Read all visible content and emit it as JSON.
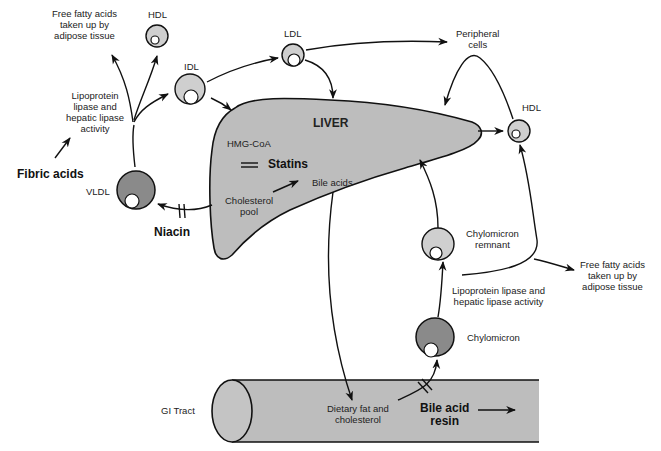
{
  "diagram": {
    "colors": {
      "background": "#ffffff",
      "organ_fill": "#bdbdbd",
      "light_particle_fill": "#cfcfcf",
      "dark_particle_fill": "#8a8a8a",
      "line": "#111111"
    },
    "organs": {
      "liver": "LIVER",
      "gi_tract": "GI Tract"
    },
    "liver_contents": {
      "hmg_coa": "HMG-CoA",
      "statins": "Statins",
      "bile_acids": "Bile acids",
      "cholesterol_pool_1": "Cholesterol",
      "cholesterol_pool_2": "pool"
    },
    "lipoproteins": {
      "hdl_top": "HDL",
      "idl": "IDL",
      "ldl": "LDL",
      "vldl": "VLDL",
      "hdl_right": "HDL",
      "chylomicron_remnant_1": "Chylomicron",
      "chylomicron_remnant_2": "remnant",
      "chylomicron": "Chylomicron"
    },
    "drugs": {
      "fibric_acids": "Fibric acids",
      "niacin": "Niacin",
      "bile_acid_resin_1": "Bile acid",
      "bile_acid_resin_2": "resin"
    },
    "processes": {
      "ffa_left_1": "Free fatty acids",
      "ffa_left_2": "taken up by",
      "ffa_left_3": "adipose tissue",
      "lpl_left_1": "Lipoprotein",
      "lpl_left_2": "lipase and",
      "lpl_left_3": "hepatic lipase",
      "lpl_left_4": "activity",
      "peripheral_1": "Peripheral",
      "peripheral_2": "cells",
      "ffa_right_1": "Free fatty acids",
      "ffa_right_2": "taken up by",
      "ffa_right_3": "adipose tissue",
      "lpl_right_1": "Lipoprotein lipase and",
      "lpl_right_2": "hepatic lipase activity",
      "dietary_1": "Dietary fat and",
      "dietary_2": "cholesterol"
    }
  }
}
